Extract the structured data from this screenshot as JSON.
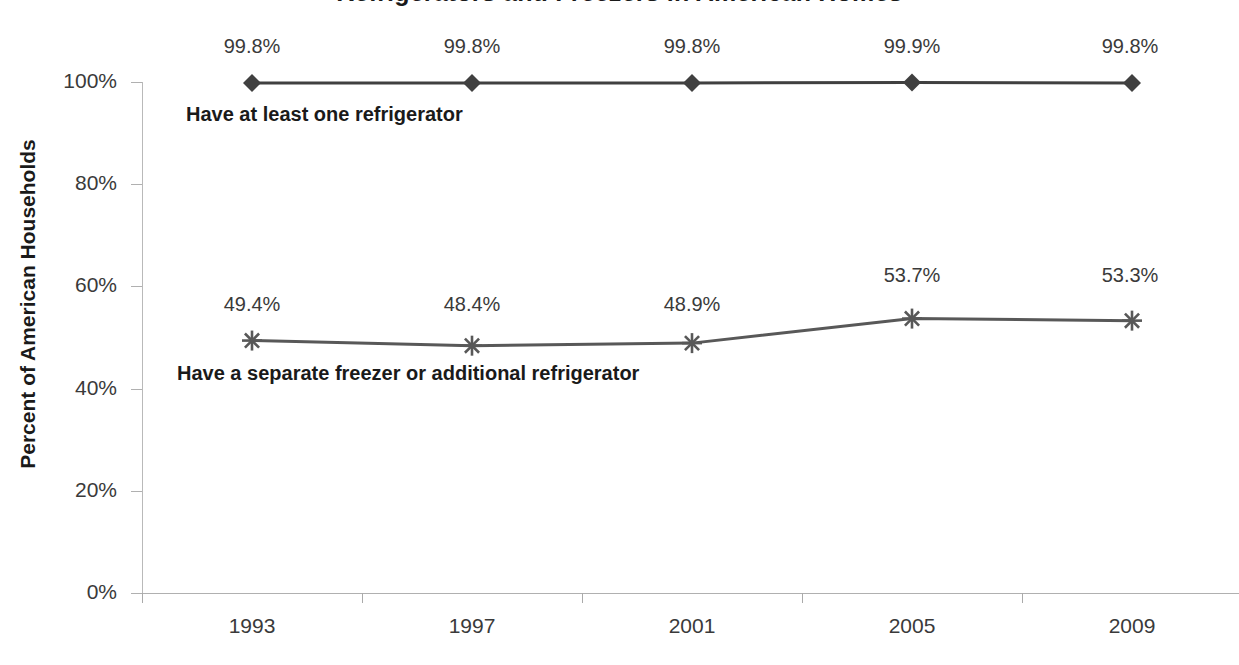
{
  "chart_data": {
    "type": "line",
    "title": "Refrigerators and Freezers in American Homes",
    "xlabel": "",
    "ylabel": "Percent of American Households",
    "categories": [
      "1993",
      "1997",
      "2001",
      "2005",
      "2009"
    ],
    "ylim": [
      0,
      100
    ],
    "ytick_labels": [
      "0%",
      "20%",
      "40%",
      "60%",
      "80%",
      "100%"
    ],
    "ytick_values": [
      0,
      20,
      40,
      60,
      80,
      100
    ],
    "grid": false,
    "legend_position": "inline-labels",
    "series": [
      {
        "name": "Have at least one refrigerator",
        "marker": "diamond",
        "color": "#404040",
        "values": [
          99.8,
          99.8,
          99.8,
          99.9,
          99.8
        ],
        "value_labels": [
          "99.8%",
          "99.8%",
          "99.8%",
          "99.9%",
          "99.8%"
        ]
      },
      {
        "name": "Have a separate freezer or additional refrigerator",
        "marker": "asterisk",
        "color": "#585858",
        "values": [
          49.4,
          48.4,
          48.9,
          53.7,
          53.3
        ],
        "value_labels": [
          "49.4%",
          "48.4%",
          "48.9%",
          "53.7%",
          "53.3%"
        ]
      }
    ]
  },
  "colors": {
    "series_one": "#404040",
    "series_two": "#585858",
    "axis": "#b0b0b0",
    "text": "#3a3a3a",
    "bold_text": "#1a1a1a",
    "background": "#ffffff"
  }
}
